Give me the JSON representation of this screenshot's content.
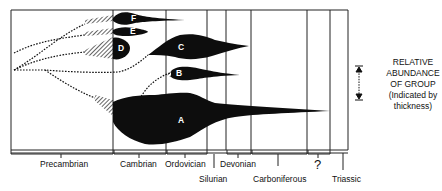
{
  "diagram": {
    "type": "evolutionary-abundance-chart",
    "groups": [
      {
        "id": "A",
        "label": "A"
      },
      {
        "id": "B",
        "label": "B"
      },
      {
        "id": "C",
        "label": "C"
      },
      {
        "id": "D",
        "label": "D"
      },
      {
        "id": "E",
        "label": "E"
      },
      {
        "id": "F",
        "label": "F"
      }
    ],
    "periods": [
      {
        "name": "Precambrian",
        "label": "Precambrian"
      },
      {
        "name": "Cambrian",
        "label": "Cambrian"
      },
      {
        "name": "Ordovician",
        "label": "Ordovician"
      },
      {
        "name": "Silurian",
        "label": "Silurian"
      },
      {
        "name": "Devonian",
        "label": "Devonian"
      },
      {
        "name": "Carboniferous",
        "label": "Carboniferous"
      },
      {
        "name": "Unknown",
        "label": "?"
      },
      {
        "name": "Triassic",
        "label": "Triassic"
      }
    ],
    "legend": {
      "line1": "RELATIVE",
      "line2": "ABUNDANCE",
      "line3": "OF GROUP",
      "line4": "(Indicated by",
      "line5": "thickness)"
    },
    "colors": {
      "ink": "#111111",
      "background": "#ffffff"
    }
  }
}
